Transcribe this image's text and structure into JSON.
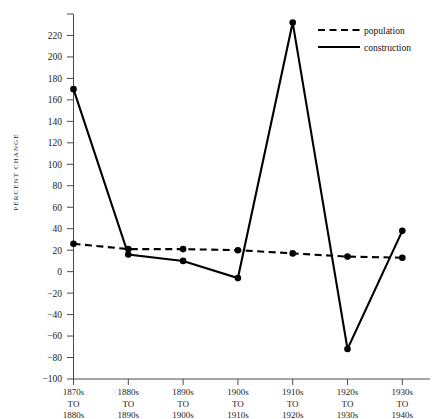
{
  "chart_data": {
    "type": "line",
    "title": "",
    "xlabel": "",
    "ylabel": "PERCENT  CHANGE",
    "ylim": [
      -100,
      240
    ],
    "ytick_step": 20,
    "grid": false,
    "legend_position": "top-right",
    "categories": [
      "1870s\nTO\n1880s",
      "1880s\nTO\n1890s",
      "1890s\nTO\n1900s",
      "1900s\nTO\n1910s",
      "1910s\nTO\n1920s",
      "1920s\nTO\n1930s",
      "1930s\nTO\n1940s"
    ],
    "series": [
      {
        "name": "population",
        "style": "dashed",
        "values": [
          26,
          21,
          21,
          20,
          17,
          14,
          13
        ]
      },
      {
        "name": "construction",
        "style": "solid",
        "values": [
          170,
          16,
          10,
          -6,
          232,
          -72,
          38
        ]
      }
    ],
    "ytick_labels": [
      "240",
      "220",
      "200",
      "180",
      "160",
      "140",
      "120",
      "100",
      "80",
      "60",
      "40",
      "20",
      "0",
      "−20",
      "−40",
      "−60",
      "−80",
      "−100"
    ],
    "ytick_values": [
      240,
      220,
      200,
      180,
      160,
      140,
      120,
      100,
      80,
      60,
      40,
      20,
      0,
      -20,
      -40,
      -60,
      -80,
      -100
    ]
  },
  "xaxis": {
    "ticks": [
      {
        "line1": "1870s",
        "line2": "TO",
        "line3": "1880s"
      },
      {
        "line1": "1880s",
        "line2": "TO",
        "line3": "1890s"
      },
      {
        "line1": "1890s",
        "line2": "TO",
        "line3": "1900s"
      },
      {
        "line1": "1900s",
        "line2": "TO",
        "line3": "1910s"
      },
      {
        "line1": "1910s",
        "line2": "TO",
        "line3": "1920s"
      },
      {
        "line1": "1920s",
        "line2": "TO",
        "line3": "1930s"
      },
      {
        "line1": "1930s",
        "line2": "TO",
        "line3": "1940s"
      }
    ]
  },
  "legend": {
    "entries": [
      {
        "label": "population",
        "swatch": "dashed-line-swatch"
      },
      {
        "label": "construction",
        "swatch": "solid-line-swatch"
      }
    ]
  },
  "colors": {
    "ink": "#000000",
    "axis": "#4a4a4a",
    "background": "#ffffff"
  }
}
